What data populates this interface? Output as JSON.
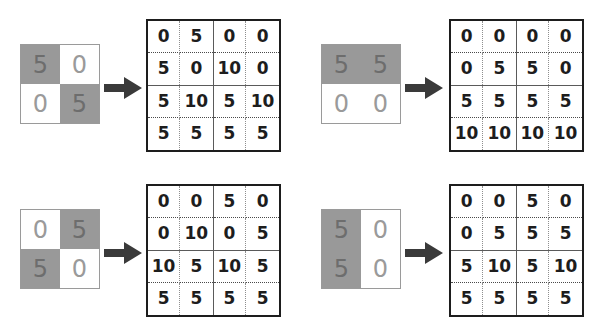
{
  "figure": {
    "kind": "matrix-transformation-diagram",
    "colors": {
      "input_on_fill": "#999999",
      "input_off_fill": "#ffffff",
      "input_on_text": "#6d6d6d",
      "input_off_text": "#9a9a9a",
      "input_border": "#9a9a9a",
      "grid_border": "#1d1d1d",
      "grid_mid_line": "#5a5a5a",
      "grid_dotted_line": "#8e8e8e",
      "grid_text": "#1d1d1d",
      "arrow_fill": "#3a3a3a",
      "background": "#ffffff"
    },
    "arrow_glyph": "right-arrow"
  },
  "panels": [
    {
      "id": "panel-top-left",
      "input": {
        "rows": 2,
        "cols": 2,
        "values": [
          [
            5,
            0
          ],
          [
            0,
            5
          ]
        ],
        "shaded": [
          [
            true,
            false
          ],
          [
            false,
            true
          ]
        ]
      },
      "output": {
        "rows": 4,
        "cols": 4,
        "values": [
          [
            0,
            5,
            0,
            0
          ],
          [
            5,
            0,
            10,
            0
          ],
          [
            5,
            10,
            5,
            10
          ],
          [
            5,
            5,
            5,
            5
          ]
        ]
      }
    },
    {
      "id": "panel-top-right",
      "input": {
        "rows": 2,
        "cols": 2,
        "values": [
          [
            5,
            5
          ],
          [
            0,
            0
          ]
        ],
        "shaded": [
          [
            true,
            true
          ],
          [
            false,
            false
          ]
        ]
      },
      "output": {
        "rows": 4,
        "cols": 4,
        "values": [
          [
            0,
            0,
            0,
            0
          ],
          [
            0,
            5,
            5,
            0
          ],
          [
            5,
            5,
            5,
            5
          ],
          [
            10,
            10,
            10,
            10
          ]
        ]
      }
    },
    {
      "id": "panel-bottom-left",
      "input": {
        "rows": 2,
        "cols": 2,
        "values": [
          [
            0,
            5
          ],
          [
            5,
            0
          ]
        ],
        "shaded": [
          [
            false,
            true
          ],
          [
            true,
            false
          ]
        ]
      },
      "output": {
        "rows": 4,
        "cols": 4,
        "values": [
          [
            0,
            0,
            5,
            0
          ],
          [
            0,
            10,
            0,
            5
          ],
          [
            10,
            5,
            10,
            5
          ],
          [
            5,
            5,
            5,
            5
          ]
        ]
      }
    },
    {
      "id": "panel-bottom-right",
      "input": {
        "rows": 2,
        "cols": 2,
        "values": [
          [
            5,
            0
          ],
          [
            5,
            0
          ]
        ],
        "shaded": [
          [
            true,
            false
          ],
          [
            true,
            false
          ]
        ]
      },
      "output": {
        "rows": 4,
        "cols": 4,
        "values": [
          [
            0,
            0,
            5,
            0
          ],
          [
            0,
            5,
            5,
            5
          ],
          [
            5,
            10,
            5,
            10
          ],
          [
            5,
            5,
            5,
            5
          ]
        ]
      }
    }
  ]
}
